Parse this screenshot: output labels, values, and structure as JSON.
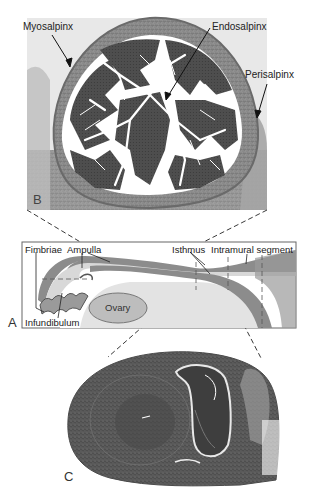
{
  "figure": {
    "panels": [
      {
        "id": "B",
        "letter": "B",
        "kind": "micrograph",
        "description": "Cross-section of ampulla of uterine tube"
      },
      {
        "id": "A",
        "letter": "A",
        "kind": "schematic",
        "description": "Uterine tube regions diagram"
      },
      {
        "id": "C",
        "letter": "C",
        "kind": "micrograph",
        "description": "Cross-section of isthmus / intramural segment"
      }
    ],
    "panel_b": {
      "letter": "B",
      "labels": {
        "myosalpinx": "Myosalpinx",
        "endosalpinx": "Endosalpinx",
        "perisalpinx": "Perisalpinx"
      }
    },
    "panel_a": {
      "letter": "A",
      "labels": {
        "fimbriae": "Fimbriae",
        "ampulla": "Ampulla",
        "isthmus": "Isthmus",
        "intramural": "Intramural segment",
        "infundibulum": "Infundibulum",
        "ovary": "Ovary"
      }
    },
    "panel_c": {
      "letter": "C"
    },
    "colors": {
      "tissue_dark": "#4a4a4a",
      "tissue_mid": "#7a7a7a",
      "tissue_light": "#b5b5b5",
      "lumen": "#ffffff",
      "tube_wall": "#8c8c8c",
      "tube_fill": "#d9d9d9",
      "ovary": "#bdbdbd"
    }
  }
}
